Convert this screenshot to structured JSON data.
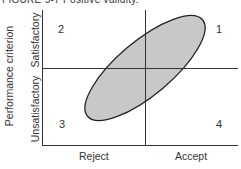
{
  "figure": {
    "title": "FIGURE 5-7 Positive validity."
  },
  "axes": {
    "y_title": "Performance criterion",
    "y_categories": [
      "Satisfactory",
      "Unsatisfactory"
    ],
    "x_categories": [
      "Reject",
      "Accept"
    ]
  },
  "quadrants": [
    {
      "id": "1",
      "label": "1",
      "position": "top-right"
    },
    {
      "id": "2",
      "label": "2",
      "position": "top-left"
    },
    {
      "id": "3",
      "label": "3",
      "position": "bottom-left"
    },
    {
      "id": "4",
      "label": "4",
      "position": "bottom-right"
    }
  ],
  "ellipse": {
    "fill": "#c8c8c8",
    "stroke": "#222222",
    "orientation": "positive-slope"
  },
  "colors": {
    "line": "#333333",
    "fill": "#c8c8c8"
  }
}
